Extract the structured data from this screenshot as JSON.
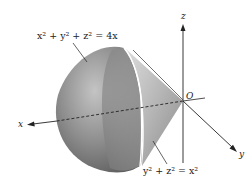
{
  "figure": {
    "type": "3d-solid-diagram",
    "surfaces": [
      {
        "id": "sphere",
        "equation": "x² + y² + z² = 4x"
      },
      {
        "id": "cone",
        "equation": "y² + z² = x²"
      }
    ],
    "axes": {
      "x_label": "x",
      "y_label": "y",
      "z_label": "z",
      "origin_label": "O"
    },
    "colors": {
      "surface_dark": "#5f5f5f",
      "surface_mid": "#9a9a9a",
      "surface_light": "#d8d8d8",
      "rim": "#ffffff",
      "axis": "#222222"
    }
  },
  "labels": {
    "sphere_label": "x² + y² + z² = 4x",
    "cone_label": "y² + z² = x²",
    "x": "x",
    "y": "y",
    "z": "z",
    "origin": "O"
  }
}
